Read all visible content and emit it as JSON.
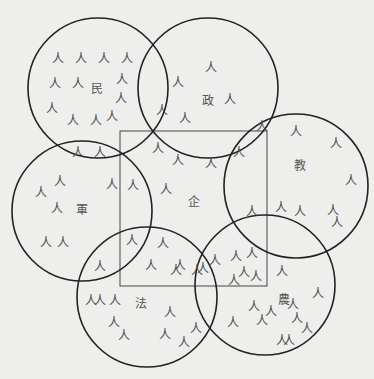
{
  "diagram": {
    "person_glyph": "人",
    "colors": {
      "background": "#eeeeec",
      "stroke": "#222222",
      "text": "#4a4a4a"
    },
    "circles": [
      {
        "id": "min",
        "label": "民",
        "cx": 98,
        "cy": 88,
        "r": 70,
        "label_pos": [
          97,
          93
        ]
      },
      {
        "id": "zheng",
        "label": "政",
        "cx": 208,
        "cy": 88,
        "r": 70,
        "label_pos": [
          208,
          105
        ]
      },
      {
        "id": "jiao",
        "label": "教",
        "cx": 296,
        "cy": 186,
        "r": 72,
        "label_pos": [
          300,
          170
        ]
      },
      {
        "id": "jun",
        "label": "軍",
        "cx": 82,
        "cy": 211,
        "r": 70,
        "label_pos": [
          82,
          214
        ]
      },
      {
        "id": "fa",
        "label": "法",
        "cx": 147,
        "cy": 297,
        "r": 70,
        "label_pos": [
          141,
          308
        ]
      },
      {
        "id": "nong",
        "label": "農",
        "cx": 265,
        "cy": 285,
        "r": 70,
        "label_pos": [
          284,
          304
        ]
      }
    ],
    "rectangle": {
      "id": "qi",
      "label": "企",
      "x": 120,
      "y": 131,
      "w": 147,
      "h": 155,
      "label_pos": [
        194,
        206
      ]
    },
    "people": [
      [
        58,
        58
      ],
      [
        81,
        58
      ],
      [
        104,
        58
      ],
      [
        127,
        58
      ],
      [
        55,
        83
      ],
      [
        78,
        83
      ],
      [
        122,
        79
      ],
      [
        121,
        98
      ],
      [
        52,
        108
      ],
      [
        73,
        120
      ],
      [
        96,
        120
      ],
      [
        112,
        116
      ],
      [
        78,
        152
      ],
      [
        100,
        152
      ],
      [
        211,
        67
      ],
      [
        178,
        82
      ],
      [
        162,
        110
      ],
      [
        230,
        99
      ],
      [
        185,
        118
      ],
      [
        262,
        126
      ],
      [
        239,
        152
      ],
      [
        296,
        131
      ],
      [
        336,
        143
      ],
      [
        351,
        180
      ],
      [
        333,
        210
      ],
      [
        252,
        211
      ],
      [
        281,
        207
      ],
      [
        300,
        211
      ],
      [
        337,
        222
      ],
      [
        158,
        148
      ],
      [
        178,
        160
      ],
      [
        211,
        163
      ],
      [
        166,
        189
      ],
      [
        60,
        181
      ],
      [
        41,
        192
      ],
      [
        57,
        208
      ],
      [
        112,
        184
      ],
      [
        133,
        185
      ],
      [
        46,
        242
      ],
      [
        63,
        242
      ],
      [
        132,
        240
      ],
      [
        163,
        243
      ],
      [
        180,
        265
      ],
      [
        197,
        270
      ],
      [
        215,
        260
      ],
      [
        151,
        265
      ],
      [
        176,
        270
      ],
      [
        203,
        268
      ],
      [
        100,
        266
      ],
      [
        236,
        256
      ],
      [
        252,
        253
      ],
      [
        244,
        272
      ],
      [
        256,
        276
      ],
      [
        234,
        280
      ],
      [
        282,
        271
      ],
      [
        271,
        311
      ],
      [
        293,
        304
      ],
      [
        318,
        293
      ],
      [
        307,
        328
      ],
      [
        297,
        318
      ],
      [
        254,
        306
      ],
      [
        233,
        322
      ],
      [
        262,
        320
      ],
      [
        282,
        340
      ],
      [
        289,
        340
      ],
      [
        91,
        300
      ],
      [
        115,
        300
      ],
      [
        114,
        322
      ],
      [
        124,
        335
      ],
      [
        100,
        300
      ],
      [
        170,
        312
      ],
      [
        165,
        334
      ],
      [
        196,
        328
      ],
      [
        184,
        342
      ]
    ]
  }
}
